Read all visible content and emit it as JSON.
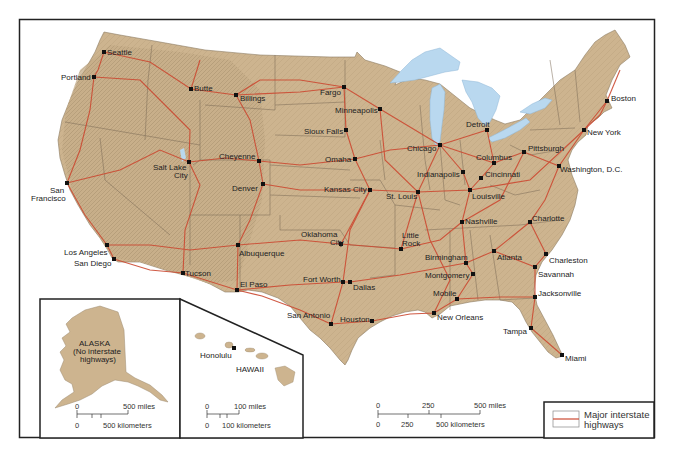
{
  "map": {
    "title": "Major interstate highways of the United States",
    "colors": {
      "land": "#cdb48f",
      "land_shade": "#b89f7c",
      "water": "#b9d8ef",
      "highway": "#cc4a32",
      "state_border": "#7a6a55",
      "frame": "#222222"
    },
    "cities": [
      {
        "name": "Seattle",
        "x": 104,
        "y": 52
      },
      {
        "name": "Portland",
        "x": 94,
        "y": 77
      },
      {
        "name": "Butte",
        "x": 191,
        "y": 89
      },
      {
        "name": "Billings",
        "x": 236,
        "y": 95
      },
      {
        "name": "Fargo",
        "x": 344,
        "y": 87
      },
      {
        "name": "Minneapolis",
        "x": 380,
        "y": 109
      },
      {
        "name": "Sioux Falls",
        "x": 346,
        "y": 130
      },
      {
        "name": "Omaha",
        "x": 355,
        "y": 159
      },
      {
        "name": "Cheyenne",
        "x": 259,
        "y": 161
      },
      {
        "name": "Salt Lake City",
        "x": 189,
        "y": 162
      },
      {
        "name": "Denver",
        "x": 263,
        "y": 184
      },
      {
        "name": "San Francisco",
        "x": 67,
        "y": 183
      },
      {
        "name": "Kansas City",
        "x": 370,
        "y": 190
      },
      {
        "name": "St. Louis",
        "x": 418,
        "y": 192
      },
      {
        "name": "Chicago",
        "x": 440,
        "y": 145
      },
      {
        "name": "Detroit",
        "x": 487,
        "y": 130
      },
      {
        "name": "Indianapolis",
        "x": 463,
        "y": 172
      },
      {
        "name": "Columbus",
        "x": 494,
        "y": 163
      },
      {
        "name": "Cincinnati",
        "x": 481,
        "y": 178
      },
      {
        "name": "Louisville",
        "x": 470,
        "y": 190
      },
      {
        "name": "Pittsburgh",
        "x": 524,
        "y": 152
      },
      {
        "name": "Washington, D.C.",
        "x": 559,
        "y": 166
      },
      {
        "name": "New York",
        "x": 584,
        "y": 130
      },
      {
        "name": "Boston",
        "x": 607,
        "y": 101
      },
      {
        "name": "Nashville",
        "x": 462,
        "y": 222
      },
      {
        "name": "Charlotte",
        "x": 530,
        "y": 222
      },
      {
        "name": "Los Angeles",
        "x": 107,
        "y": 245
      },
      {
        "name": "San Diego",
        "x": 114,
        "y": 259
      },
      {
        "name": "Albuquerque",
        "x": 238,
        "y": 245
      },
      {
        "name": "Oklahoma City",
        "x": 341,
        "y": 244
      },
      {
        "name": "Little Rock",
        "x": 401,
        "y": 249
      },
      {
        "name": "Birmingham",
        "x": 466,
        "y": 263
      },
      {
        "name": "Atlanta",
        "x": 494,
        "y": 251
      },
      {
        "name": "Charleston",
        "x": 546,
        "y": 254
      },
      {
        "name": "Savannah",
        "x": 535,
        "y": 267
      },
      {
        "name": "Montgomery",
        "x": 473,
        "y": 274
      },
      {
        "name": "Tucson",
        "x": 183,
        "y": 273
      },
      {
        "name": "El Paso",
        "x": 237,
        "y": 290
      },
      {
        "name": "Fort Worth",
        "x": 343,
        "y": 282
      },
      {
        "name": "Dallas",
        "x": 350,
        "y": 282
      },
      {
        "name": "Mobile",
        "x": 457,
        "y": 299
      },
      {
        "name": "Jacksonville",
        "x": 535,
        "y": 297
      },
      {
        "name": "New Orleans",
        "x": 434,
        "y": 313
      },
      {
        "name": "San Antonio",
        "x": 331,
        "y": 324
      },
      {
        "name": "Houston",
        "x": 372,
        "y": 321
      },
      {
        "name": "Tampa",
        "x": 531,
        "y": 328
      },
      {
        "name": "Miami",
        "x": 562,
        "y": 355
      }
    ],
    "labels": {
      "seattle": "Seattle",
      "portland": "Portland",
      "butte": "Butte",
      "billings": "Billings",
      "fargo": "Fargo",
      "minneapolis": "Minneapolis",
      "sioux_falls": "Sioux Falls",
      "omaha": "Omaha",
      "cheyenne": "Cheyenne",
      "salt_lake_1": "Salt Lake",
      "salt_lake_2": "City",
      "denver": "Denver",
      "san_francisco_1": "San",
      "san_francisco_2": "Francisco",
      "kansas_city": "Kansas City",
      "st_louis": "St. Louis",
      "chicago": "Chicago",
      "detroit": "Detroit",
      "indianapolis": "Indianapolis",
      "columbus": "Columbus",
      "cincinnati": "Cincinnati",
      "louisville": "Louisville",
      "pittsburgh": "Pittsburgh",
      "washington": "Washington, D.C.",
      "new_york": "New York",
      "boston": "Boston",
      "nashville": "Nashville",
      "charlotte": "Charlotte",
      "los_angeles": "Los Angeles",
      "san_diego": "San Diego",
      "albuquerque": "Albuquerque",
      "oklahoma_city_1": "Oklahoma",
      "oklahoma_city_2": "City",
      "little_rock_1": "Little",
      "little_rock_2": "Rock",
      "birmingham": "Birmingham",
      "atlanta": "Atlanta",
      "charleston": "Charleston",
      "savannah": "Savannah",
      "montgomery": "Montgomery",
      "tucson": "Tucson",
      "el_paso": "El Paso",
      "fort_worth": "Fort Worth",
      "dallas": "Dallas",
      "mobile": "Mobile",
      "jacksonville": "Jacksonville",
      "new_orleans": "New Orleans",
      "san_antonio": "San Antonio",
      "houston": "Houston",
      "tampa": "Tampa",
      "miami": "Miami"
    },
    "alaska_inset": {
      "title": "ALASKA",
      "note_1": "(No interstate",
      "note_2": "highways)",
      "scale": {
        "zero_top": "0",
        "miles": "500 miles",
        "zero_bottom": "0",
        "km": "500 kilometers"
      }
    },
    "hawaii_inset": {
      "title": "HAWAII",
      "city": "Honolulu",
      "scale": {
        "zero_top": "0",
        "miles": "100 miles",
        "zero_bottom": "0",
        "km": "100 kilometers"
      }
    },
    "main_scale": {
      "top": [
        "0",
        "250",
        "500 miles"
      ],
      "bottom": [
        "0",
        "250",
        "500 kilometers"
      ]
    },
    "legend": {
      "line1": "Major interstate",
      "line2": "highways"
    }
  }
}
